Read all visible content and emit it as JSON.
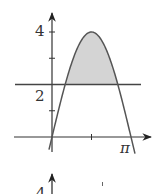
{
  "chart_data": {
    "type": "line",
    "title": "",
    "series": [
      {
        "name": "y = 4 sin x",
        "function": "4*sin(x)",
        "x_range": [
          -0.12,
          3.3
        ]
      },
      {
        "name": "y = 2",
        "function": "2",
        "x_range": [
          -0.5,
          2.8
        ]
      }
    ],
    "shaded_region": {
      "between": [
        "4 sin x",
        "2"
      ],
      "x_from": "pi/6",
      "x_to": "5pi/6",
      "color": "#d4d4d4"
    },
    "x_axis": {
      "ticks": [
        "pi/2"
      ],
      "tick_labels": [
        "π"
      ],
      "label_position": "pi",
      "xlim": [
        -0.5,
        3.2
      ]
    },
    "y_axis": {
      "ticks": [
        1,
        2,
        3,
        4
      ],
      "tick_labels": [
        "2",
        "4"
      ],
      "ylim": [
        -0.65,
        4.8
      ]
    },
    "xlabel": "",
    "ylabel": "",
    "grid": false,
    "legend": null
  },
  "labels": {
    "y_tick_4": "4",
    "y_tick_2": "2",
    "x_pi": "π",
    "next_fig_y4": "4"
  },
  "colors": {
    "axis": "#333333",
    "curve": "#555555",
    "fill": "#d6d6d6"
  }
}
